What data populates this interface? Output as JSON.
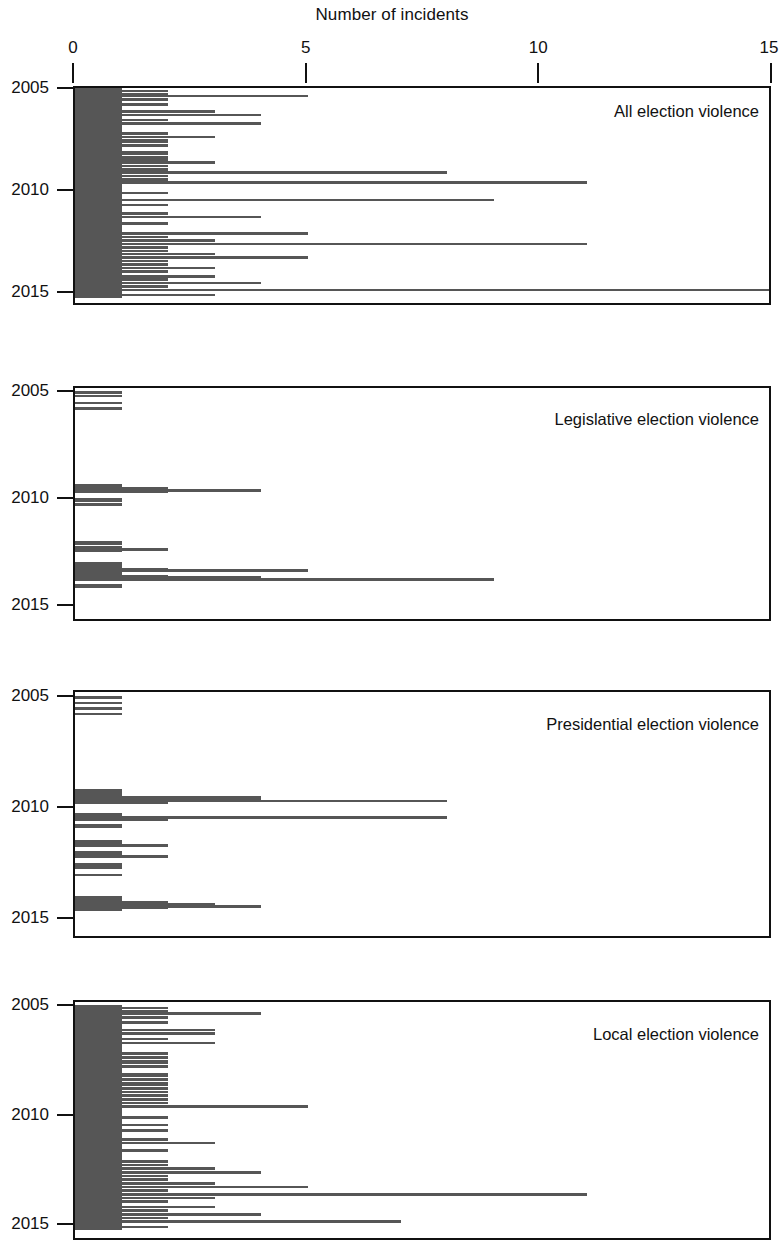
{
  "figure": {
    "title": "Number of incidents",
    "bar_color": "#565656",
    "axis_color": "#111111",
    "background": "#ffffff"
  },
  "xaxis": {
    "label": "Number of incidents",
    "position": "top",
    "min": 0,
    "max": 15,
    "ticks": [
      0,
      5,
      10,
      15
    ],
    "tick_labels": [
      "0",
      "5",
      "10",
      "15"
    ]
  },
  "yaxis": {
    "ticks": [
      2005,
      2010,
      2015
    ],
    "tick_labels": [
      "2005",
      "2010",
      "2015"
    ],
    "min": 2005,
    "max": 2015.25,
    "inverted": true
  },
  "panels": [
    {
      "id": "all",
      "label": "All election violence"
    },
    {
      "id": "legislative",
      "label": "Legislative election violence"
    },
    {
      "id": "presidential",
      "label": "Presidential election violence"
    },
    {
      "id": "local",
      "label": "Local election violence"
    }
  ],
  "chart_data": [
    {
      "type": "bar",
      "orientation": "horizontal",
      "title": "All election violence",
      "subtitle": "",
      "xlabel": "Number of incidents",
      "ylabel": "",
      "xlim": [
        0,
        15
      ],
      "ylim": [
        2005,
        2015.25
      ],
      "grid": false,
      "legend": null,
      "tick_labels_x": [
        "0",
        "5",
        "10",
        "15"
      ],
      "tick_labels_y": [
        "2005",
        "2010",
        "2015"
      ],
      "note": "Monthly counts of election-violence incidents, Jan 2005 - Mar 2015. x = count, y = time (descending).",
      "x": [
        2005.0,
        2005.083,
        2005.167,
        2005.25,
        2005.333,
        2005.417,
        2005.5,
        2005.583,
        2005.667,
        2005.75,
        2005.833,
        2005.917,
        2006.0,
        2006.083,
        2006.167,
        2006.25,
        2006.333,
        2006.417,
        2006.5,
        2006.583,
        2006.667,
        2006.75,
        2006.833,
        2006.917,
        2007.0,
        2007.083,
        2007.167,
        2007.25,
        2007.333,
        2007.417,
        2007.5,
        2007.583,
        2007.667,
        2007.75,
        2007.833,
        2007.917,
        2008.0,
        2008.083,
        2008.167,
        2008.25,
        2008.333,
        2008.417,
        2008.5,
        2008.583,
        2008.667,
        2008.75,
        2008.833,
        2008.917,
        2009.0,
        2009.083,
        2009.167,
        2009.25,
        2009.333,
        2009.417,
        2009.5,
        2009.583,
        2009.667,
        2009.75,
        2009.833,
        2009.917,
        2010.0,
        2010.083,
        2010.167,
        2010.25,
        2010.333,
        2010.417,
        2010.5,
        2010.583,
        2010.667,
        2010.75,
        2010.833,
        2010.917,
        2011.0,
        2011.083,
        2011.167,
        2011.25,
        2011.333,
        2011.417,
        2011.5,
        2011.583,
        2011.667,
        2011.75,
        2011.833,
        2011.917,
        2012.0,
        2012.083,
        2012.167,
        2012.25,
        2012.333,
        2012.417,
        2012.5,
        2012.583,
        2012.667,
        2012.75,
        2012.833,
        2012.917,
        2013.0,
        2013.083,
        2013.167,
        2013.25,
        2013.333,
        2013.417,
        2013.5,
        2013.583,
        2013.667,
        2013.75,
        2013.833,
        2013.917,
        2014.0,
        2014.083,
        2014.167,
        2014.25,
        2014.333,
        2014.417,
        2014.5,
        2014.583,
        2014.667,
        2014.75,
        2014.833,
        2014.917,
        2015.0,
        2015.083,
        2015.167
      ],
      "values": [
        1,
        2,
        1,
        2,
        5,
        1,
        2,
        1,
        1,
        2,
        1,
        1,
        1,
        3,
        1,
        4,
        1,
        1,
        2,
        1,
        4,
        1,
        1,
        1,
        1,
        1,
        2,
        1,
        3,
        1,
        2,
        2,
        1,
        2,
        1,
        1,
        1,
        2,
        2,
        1,
        2,
        1,
        2,
        3,
        1,
        2,
        1,
        2,
        1,
        8,
        1,
        2,
        1,
        2,
        1,
        11,
        1,
        1,
        1,
        1,
        1,
        2,
        1,
        1,
        1,
        9,
        1,
        1,
        2,
        1,
        1,
        1,
        1,
        2,
        1,
        4,
        1,
        1,
        1,
        2,
        1,
        1,
        1,
        1,
        1,
        5,
        1,
        2,
        1,
        3,
        1,
        11,
        1,
        2,
        1,
        2,
        1,
        3,
        1,
        5,
        1,
        2,
        1,
        2,
        1,
        3,
        1,
        2,
        1,
        1,
        3,
        1,
        2,
        1,
        4,
        1,
        2,
        1,
        15,
        1,
        1,
        3,
        1
      ]
    },
    {
      "type": "bar",
      "orientation": "horizontal",
      "title": "Legislative election violence",
      "subtitle": "",
      "xlabel": "Number of incidents",
      "ylabel": "",
      "xlim": [
        0,
        15
      ],
      "ylim": [
        2005,
        2015.25
      ],
      "grid": false,
      "legend": null,
      "tick_labels_x": [
        "0",
        "5",
        "10",
        "15"
      ],
      "tick_labels_y": [
        "2005",
        "2010",
        "2015"
      ],
      "note": "Monthly counts of legislative election-violence incidents.",
      "x": [
        2005.0,
        2005.083,
        2005.167,
        2005.25,
        2005.333,
        2005.417,
        2005.5,
        2005.583,
        2005.667,
        2005.75,
        2005.833,
        2005.917,
        2006.0,
        2006.083,
        2006.167,
        2006.25,
        2006.333,
        2006.417,
        2006.5,
        2006.583,
        2006.667,
        2006.75,
        2006.833,
        2006.917,
        2007.0,
        2007.083,
        2007.167,
        2007.25,
        2007.333,
        2007.417,
        2007.5,
        2007.583,
        2007.667,
        2007.75,
        2007.833,
        2007.917,
        2008.0,
        2008.083,
        2008.167,
        2008.25,
        2008.333,
        2008.417,
        2008.5,
        2008.583,
        2008.667,
        2008.75,
        2008.833,
        2008.917,
        2009.0,
        2009.083,
        2009.167,
        2009.25,
        2009.333,
        2009.417,
        2009.5,
        2009.583,
        2009.667,
        2009.75,
        2009.833,
        2009.917,
        2010.0,
        2010.083,
        2010.167,
        2010.25,
        2010.333,
        2010.417,
        2010.5,
        2010.583,
        2010.667,
        2010.75,
        2010.833,
        2010.917,
        2011.0,
        2011.083,
        2011.167,
        2011.25,
        2011.333,
        2011.417,
        2011.5,
        2011.583,
        2011.667,
        2011.75,
        2011.833,
        2011.917,
        2012.0,
        2012.083,
        2012.167,
        2012.25,
        2012.333,
        2012.417,
        2012.5,
        2012.583,
        2012.667,
        2012.75,
        2012.833,
        2012.917,
        2013.0,
        2013.083,
        2013.167,
        2013.25,
        2013.333,
        2013.417,
        2013.5,
        2013.583,
        2013.667,
        2013.75,
        2013.833,
        2013.917,
        2014.0,
        2014.083,
        2014.167,
        2014.25,
        2014.333,
        2014.417,
        2014.5,
        2014.583,
        2014.667,
        2014.75,
        2014.833,
        2014.917,
        2015.0,
        2015.083,
        2015.167
      ],
      "values": [
        1,
        0,
        1,
        0,
        0,
        0,
        1,
        0,
        0,
        1,
        0,
        0,
        0,
        0,
        0,
        0,
        0,
        0,
        0,
        0,
        0,
        0,
        0,
        0,
        0,
        0,
        0,
        0,
        0,
        0,
        0,
        0,
        0,
        0,
        0,
        0,
        0,
        0,
        0,
        0,
        0,
        0,
        0,
        0,
        0,
        0,
        0,
        0,
        0,
        0,
        0,
        0,
        1,
        1,
        2,
        4,
        2,
        0,
        0,
        0,
        1,
        1,
        0,
        1,
        0,
        0,
        0,
        0,
        0,
        0,
        0,
        0,
        0,
        0,
        0,
        0,
        0,
        0,
        0,
        0,
        0,
        0,
        0,
        0,
        1,
        1,
        0,
        1,
        2,
        1,
        0,
        0,
        0,
        0,
        0,
        0,
        1,
        1,
        1,
        2,
        5,
        1,
        1,
        2,
        4,
        9,
        0,
        0,
        1,
        1,
        0,
        0,
        0,
        0,
        0,
        0,
        0,
        0,
        0,
        0,
        0,
        0,
        0
      ]
    },
    {
      "type": "bar",
      "orientation": "horizontal",
      "title": "Presidential election violence",
      "subtitle": "",
      "xlabel": "Number of incidents",
      "ylabel": "",
      "xlim": [
        0,
        15
      ],
      "ylim": [
        2005,
        2015.25
      ],
      "grid": false,
      "legend": null,
      "tick_labels_x": [
        "0",
        "5",
        "10",
        "15"
      ],
      "tick_labels_y": [
        "2005",
        "2010",
        "2015"
      ],
      "note": "Monthly counts of presidential election-violence incidents.",
      "x": [
        2005.0,
        2005.083,
        2005.167,
        2005.25,
        2005.333,
        2005.417,
        2005.5,
        2005.583,
        2005.667,
        2005.75,
        2005.833,
        2005.917,
        2006.0,
        2006.083,
        2006.167,
        2006.25,
        2006.333,
        2006.417,
        2006.5,
        2006.583,
        2006.667,
        2006.75,
        2006.833,
        2006.917,
        2007.0,
        2007.083,
        2007.167,
        2007.25,
        2007.333,
        2007.417,
        2007.5,
        2007.583,
        2007.667,
        2007.75,
        2007.833,
        2007.917,
        2008.0,
        2008.083,
        2008.167,
        2008.25,
        2008.333,
        2008.417,
        2008.5,
        2008.583,
        2008.667,
        2008.75,
        2008.833,
        2008.917,
        2009.0,
        2009.083,
        2009.167,
        2009.25,
        2009.333,
        2009.417,
        2009.5,
        2009.583,
        2009.667,
        2009.75,
        2009.833,
        2009.917,
        2010.0,
        2010.083,
        2010.167,
        2010.25,
        2010.333,
        2010.417,
        2010.5,
        2010.583,
        2010.667,
        2010.75,
        2010.833,
        2010.917,
        2011.0,
        2011.083,
        2011.167,
        2011.25,
        2011.333,
        2011.417,
        2011.5,
        2011.583,
        2011.667,
        2011.75,
        2011.833,
        2011.917,
        2012.0,
        2012.083,
        2012.167,
        2012.25,
        2012.333,
        2012.417,
        2012.5,
        2012.583,
        2012.667,
        2012.75,
        2012.833,
        2012.917,
        2013.0,
        2013.083,
        2013.167,
        2013.25,
        2013.333,
        2013.417,
        2013.5,
        2013.583,
        2013.667,
        2013.75,
        2013.833,
        2013.917,
        2014.0,
        2014.083,
        2014.167,
        2014.25,
        2014.333,
        2014.417,
        2014.5,
        2014.583,
        2014.667,
        2014.75,
        2014.833,
        2014.917,
        2015.0,
        2015.083,
        2015.167
      ],
      "values": [
        1,
        0,
        0,
        1,
        0,
        0,
        1,
        0,
        0,
        1,
        0,
        0,
        0,
        0,
        0,
        0,
        0,
        0,
        0,
        0,
        0,
        0,
        0,
        0,
        0,
        0,
        0,
        0,
        0,
        0,
        0,
        0,
        0,
        0,
        0,
        0,
        0,
        0,
        0,
        0,
        0,
        0,
        0,
        0,
        0,
        0,
        0,
        0,
        0,
        0,
        1,
        1,
        1,
        1,
        4,
        4,
        8,
        2,
        0,
        0,
        0,
        0,
        0,
        1,
        1,
        8,
        2,
        0,
        0,
        1,
        1,
        0,
        0,
        0,
        0,
        0,
        0,
        0,
        1,
        1,
        2,
        0,
        0,
        0,
        1,
        1,
        2,
        0,
        0,
        0,
        1,
        1,
        1,
        0,
        0,
        0,
        1,
        0,
        0,
        0,
        0,
        0,
        0,
        0,
        0,
        0,
        0,
        0,
        1,
        1,
        1,
        2,
        3,
        4,
        2,
        1,
        0,
        0,
        0,
        0,
        0,
        0,
        0
      ]
    },
    {
      "type": "bar",
      "orientation": "horizontal",
      "title": "Local election violence",
      "subtitle": "",
      "xlabel": "Number of incidents",
      "ylabel": "",
      "xlim": [
        0,
        15
      ],
      "ylim": [
        2005,
        2015.25
      ],
      "grid": false,
      "legend": null,
      "tick_labels_x": [
        "0",
        "5",
        "10",
        "15"
      ],
      "tick_labels_y": [
        "2005",
        "2010",
        "2015"
      ],
      "note": "Monthly counts of local election-violence incidents.",
      "x": [
        2005.0,
        2005.083,
        2005.167,
        2005.25,
        2005.333,
        2005.417,
        2005.5,
        2005.583,
        2005.667,
        2005.75,
        2005.833,
        2005.917,
        2006.0,
        2006.083,
        2006.167,
        2006.25,
        2006.333,
        2006.417,
        2006.5,
        2006.583,
        2006.667,
        2006.75,
        2006.833,
        2006.917,
        2007.0,
        2007.083,
        2007.167,
        2007.25,
        2007.333,
        2007.417,
        2007.5,
        2007.583,
        2007.667,
        2007.75,
        2007.833,
        2007.917,
        2008.0,
        2008.083,
        2008.167,
        2008.25,
        2008.333,
        2008.417,
        2008.5,
        2008.583,
        2008.667,
        2008.75,
        2008.833,
        2008.917,
        2009.0,
        2009.083,
        2009.167,
        2009.25,
        2009.333,
        2009.417,
        2009.5,
        2009.583,
        2009.667,
        2009.75,
        2009.833,
        2009.917,
        2010.0,
        2010.083,
        2010.167,
        2010.25,
        2010.333,
        2010.417,
        2010.5,
        2010.583,
        2010.667,
        2010.75,
        2010.833,
        2010.917,
        2011.0,
        2011.083,
        2011.167,
        2011.25,
        2011.333,
        2011.417,
        2011.5,
        2011.583,
        2011.667,
        2011.75,
        2011.833,
        2011.917,
        2012.0,
        2012.083,
        2012.167,
        2012.25,
        2012.333,
        2012.417,
        2012.5,
        2012.583,
        2012.667,
        2012.75,
        2012.833,
        2012.917,
        2013.0,
        2013.083,
        2013.167,
        2013.25,
        2013.333,
        2013.417,
        2013.5,
        2013.583,
        2013.667,
        2013.75,
        2013.833,
        2013.917,
        2014.0,
        2014.083,
        2014.167,
        2014.25,
        2014.333,
        2014.417,
        2014.5,
        2014.583,
        2014.667,
        2014.75,
        2014.833,
        2014.917,
        2015.0,
        2015.083,
        2015.167
      ],
      "values": [
        1,
        2,
        1,
        2,
        4,
        1,
        2,
        1,
        1,
        2,
        1,
        1,
        1,
        3,
        1,
        3,
        1,
        1,
        2,
        1,
        3,
        1,
        1,
        1,
        1,
        1,
        2,
        1,
        2,
        1,
        2,
        2,
        1,
        2,
        1,
        1,
        1,
        2,
        2,
        1,
        2,
        1,
        2,
        2,
        1,
        2,
        1,
        2,
        1,
        2,
        1,
        2,
        1,
        2,
        1,
        5,
        1,
        1,
        1,
        1,
        1,
        2,
        1,
        1,
        1,
        2,
        1,
        1,
        2,
        1,
        1,
        1,
        1,
        2,
        1,
        3,
        1,
        1,
        1,
        2,
        1,
        1,
        1,
        1,
        1,
        2,
        1,
        2,
        1,
        3,
        1,
        4,
        1,
        2,
        1,
        2,
        1,
        3,
        1,
        5,
        1,
        2,
        1,
        11,
        1,
        3,
        1,
        2,
        1,
        1,
        3,
        1,
        2,
        1,
        4,
        1,
        2,
        1,
        7,
        1,
        1,
        2,
        1
      ]
    }
  ]
}
